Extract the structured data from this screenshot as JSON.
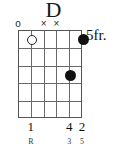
{
  "chord": {
    "name": "D",
    "position_label": "5fr.",
    "strings": 6,
    "frets": 5,
    "string_states": [
      "o",
      "",
      "x",
      "x",
      "",
      ""
    ],
    "dots": [
      {
        "string": 6,
        "fret": 1
      },
      {
        "string": 5,
        "fret": 3
      }
    ],
    "open_strings": [
      {
        "string": 2
      }
    ],
    "finger_numbers": [
      {
        "string": 2,
        "label": "1"
      },
      {
        "string": 5,
        "label": "4"
      },
      {
        "string": 6,
        "label": "2"
      }
    ],
    "intervals": [
      {
        "string": 2,
        "label": "R"
      },
      {
        "string": 5,
        "label": "3"
      },
      {
        "string": 6,
        "label": "5"
      }
    ],
    "colors": {
      "ink": "#111111",
      "grid": "#6a6a6a",
      "border": "#555555",
      "background": "#ffffff"
    }
  },
  "chart_data": {
    "type": "table",
    "title": "D",
    "xlabel": "Strings (low to high, left to right)",
    "ylabel": "Frets",
    "categories": [
      "String 1",
      "String 2",
      "String 3",
      "String 4",
      "String 5",
      "String 6"
    ],
    "values": [
      0,
      0,
      -1,
      -1,
      7,
      5
    ],
    "series": [
      {
        "name": "fret_offset_from_position",
        "values": [
          null,
          0,
          null,
          null,
          3,
          1
        ]
      },
      {
        "name": "finger",
        "values": [
          null,
          1,
          null,
          null,
          4,
          2
        ]
      },
      {
        "name": "interval",
        "values": [
          null,
          "R",
          null,
          null,
          "3",
          "5"
        ]
      }
    ]
  }
}
